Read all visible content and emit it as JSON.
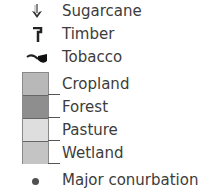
{
  "legend": {
    "symbols": [
      {
        "label": "Sugarcane",
        "icon": "sugarcane-icon"
      },
      {
        "label": "Timber",
        "icon": "axe-icon"
      },
      {
        "label": "Tobacco",
        "icon": "pipe-icon"
      }
    ],
    "land_use": [
      {
        "label": "Cropland",
        "color": "#b8b8b8"
      },
      {
        "label": "Forest",
        "color": "#8e8e8e"
      },
      {
        "label": "Pasture",
        "color": "#dedede"
      },
      {
        "label": "Wetland",
        "color": "#c4c4c4"
      }
    ],
    "points": [
      {
        "label": "Major conurbation",
        "icon": "dot-icon",
        "color": "#505050"
      }
    ]
  }
}
